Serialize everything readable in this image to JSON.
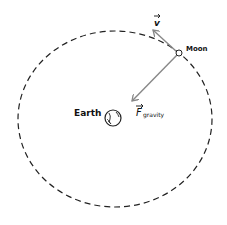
{
  "diagram": {
    "orbit": {
      "style": "dashed",
      "color": "#222222"
    },
    "earth": {
      "label": "Earth",
      "color": "#222222"
    },
    "moon": {
      "label": "Moon",
      "color": "#222222"
    },
    "vectors": {
      "velocity": {
        "label": "v",
        "color": "#888888"
      },
      "gravity": {
        "label": "F",
        "subscript": "gravity",
        "color": "#888888"
      }
    }
  }
}
